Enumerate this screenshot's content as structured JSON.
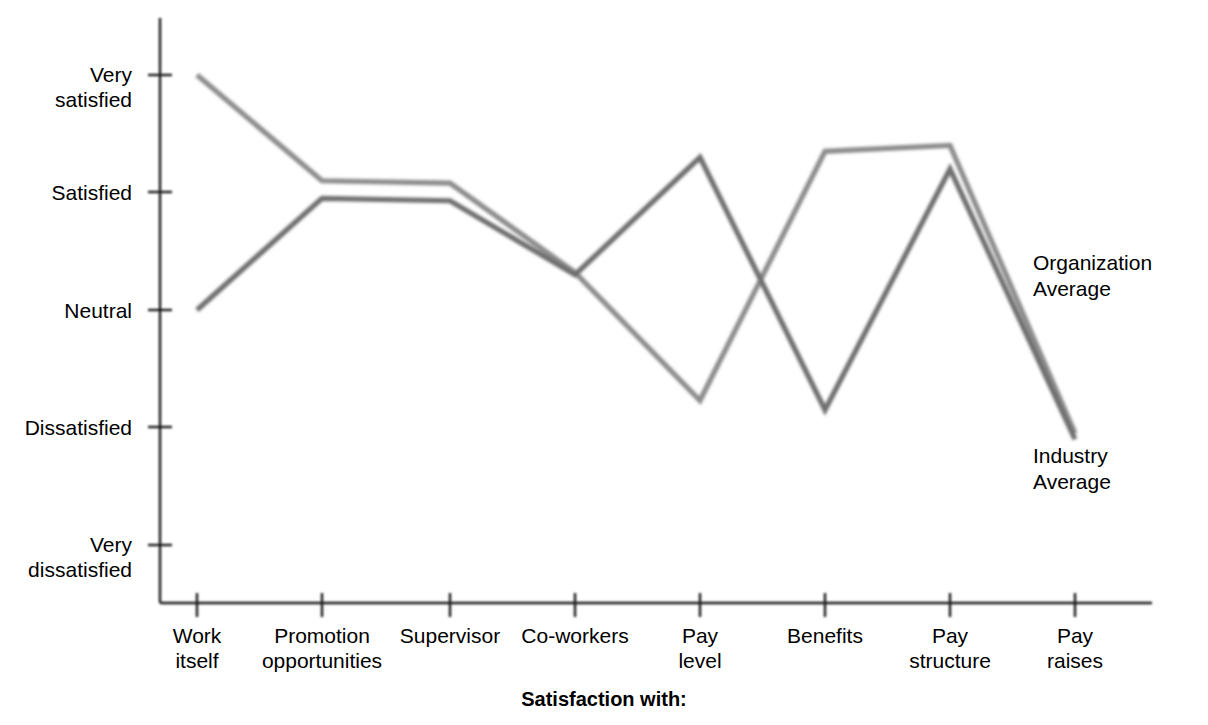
{
  "chart_data": {
    "type": "line",
    "title": "",
    "subtitle": "",
    "xlabel": "Satisfaction with:",
    "ylabel": "",
    "grid": false,
    "legend_position": "right-inline",
    "categories": [
      "Work\nitself",
      "Promotion\nopportunities",
      "Supervisor",
      "Co-workers",
      "Pay\nlevel",
      "Benefits",
      "Pay\nstructure",
      "Pay\nraises"
    ],
    "y_tick_labels": [
      "Very\nsatisfied",
      "Satisfied",
      "Neutral",
      "Dissatisfied",
      "Very\ndissatisfied"
    ],
    "y_tick_values": [
      5,
      4,
      3,
      2,
      1
    ],
    "ylim": [
      0.6,
      5.2
    ],
    "series": [
      {
        "name": "Organization\nAverage",
        "color": "#8c8c8c",
        "values": [
          5.0,
          4.1,
          4.08,
          3.32,
          2.23,
          4.35,
          4.4,
          1.95
        ]
      },
      {
        "name": "Industry\nAverage",
        "color": "#6e6e6e",
        "values": [
          3.0,
          3.95,
          3.93,
          3.3,
          4.3,
          2.15,
          4.2,
          1.9
        ]
      }
    ],
    "annotations": [
      {
        "text": "Organization\nAverage",
        "series": "Organization Average",
        "position": "right-of-last-point"
      },
      {
        "text": "Industry\nAverage",
        "series": "Industry Average",
        "position": "right-below-last-point"
      }
    ]
  },
  "colors": {
    "axis": "#1a1a1a",
    "organization_average": "#8c8c8c",
    "industry_average": "#6e6e6e",
    "background": "#ffffff",
    "text": "#000000"
  },
  "layout": {
    "plot_left": 160,
    "plot_right": 1150,
    "plot_top": 18,
    "plot_bottom": 603,
    "x_ticks_px": [
      197,
      322,
      450,
      575,
      700,
      825,
      950,
      1075
    ],
    "y_ticks_px": [
      75,
      192,
      310,
      427,
      545
    ]
  }
}
